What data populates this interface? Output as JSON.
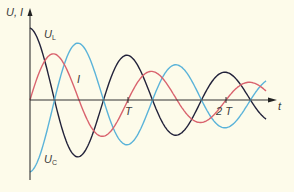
{
  "chart_data": {
    "type": "line",
    "title": "",
    "ylabel": "U, I",
    "xlabel": "t",
    "x_ticks": [
      {
        "label": "T",
        "value": 1
      },
      {
        "label": "2 T",
        "value": 2
      }
    ],
    "x_range": [
      0,
      2.5
    ],
    "damping_per_period": 0.62,
    "series": [
      {
        "name": "U_L",
        "label_main": "U",
        "label_sub": "L",
        "color": "#22223a",
        "shape": "cos",
        "amplitude": 1.0
      },
      {
        "name": "U_C",
        "label_main": "U",
        "label_sub": "C",
        "color": "#5ab3d9",
        "shape": "-cos",
        "amplitude": 1.0
      },
      {
        "name": "I",
        "label_main": "I",
        "label_sub": "",
        "color": "#d9636e",
        "shape": "sin",
        "amplitude": 0.45
      }
    ]
  }
}
